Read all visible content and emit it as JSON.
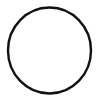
{
  "canvas": {
    "width": 102,
    "height": 101,
    "background_color": "#ffffff",
    "description": "plain white canvas containing a single drawn circle outline"
  },
  "figure": {
    "name": "circle-outline",
    "type": "ellipse",
    "label": "circle",
    "stroke_color": "#111111",
    "fill": "none",
    "stroke_width": 2.4,
    "center_x": 49.5,
    "center_y": 50.5,
    "radius_x": 41.5,
    "radius_y": 43.0,
    "bounds": {
      "left": 8,
      "top": 7,
      "right": 91,
      "bottom": 94,
      "width": 83,
      "height": 87
    },
    "linecap": "round",
    "linejoin": "round"
  },
  "annotations": {
    "text_present": false,
    "interior_content": "empty",
    "note": "hand-drawn appearance: stroke slightly thinner at top apex, marginally heavier on left and right flanks"
  }
}
